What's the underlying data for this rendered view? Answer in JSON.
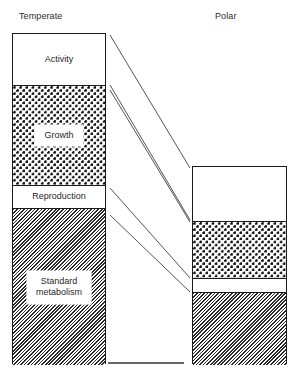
{
  "figure": {
    "columns": [
      {
        "key": "temperate",
        "header": "Temperate",
        "labelled": true,
        "bands": [
          {
            "name": "activity",
            "label": "Activity",
            "fill": "plain",
            "height_px": 51
          },
          {
            "name": "growth",
            "label": "Growth",
            "fill": "dots",
            "height_px": 100
          },
          {
            "name": "reproduction",
            "label": "Reproduction",
            "fill": "plain",
            "height_px": 23
          },
          {
            "name": "standard-metabolism",
            "label": "Standard\nmetabolism",
            "fill": "hatch",
            "height_px": 156
          }
        ]
      },
      {
        "key": "polar",
        "header": "Polar",
        "labelled": false,
        "bands": [
          {
            "name": "activity",
            "label": "",
            "fill": "plain",
            "height_px": 54
          },
          {
            "name": "growth",
            "label": "",
            "fill": "dots",
            "height_px": 57
          },
          {
            "name": "reproduction",
            "label": "",
            "fill": "plain",
            "height_px": 14
          },
          {
            "name": "standard-metabolism",
            "label": "",
            "fill": "hatch",
            "height_px": 72
          }
        ]
      }
    ],
    "connectors": [
      {
        "name": "connector-activity-top",
        "x1": 110,
        "y1": 35,
        "x2": 190,
        "y2": 168
      },
      {
        "name": "connector-activity-growth",
        "x1": 110,
        "y1": 85,
        "x2": 190,
        "y2": 220
      },
      {
        "name": "connector-growth-reproduction",
        "x1": 110,
        "y1": 90,
        "x2": 190,
        "y2": 222
      },
      {
        "name": "connector-reproduction-metabolism",
        "x1": 110,
        "y1": 188,
        "x2": 190,
        "y2": 278
      },
      {
        "name": "connector-metabolism-top",
        "x1": 110,
        "y1": 215,
        "x2": 190,
        "y2": 292
      }
    ],
    "baseline": {
      "name": "baseline",
      "x1": 108,
      "y1": 363,
      "x2": 184,
      "y2": 363
    },
    "colors": {
      "outline": "#1a1a1a",
      "dot_fill": "#151515",
      "hatch_fill": "#2a2a2a",
      "background": "#ffffff",
      "text": "#1f1f1f"
    }
  }
}
